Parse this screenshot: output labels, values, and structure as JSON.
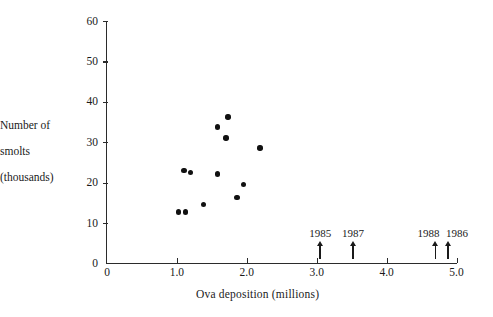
{
  "chart_data": {
    "type": "scatter",
    "title": "",
    "xlabel": "Ova deposition (millions)",
    "ylabel_lines": [
      "Number of",
      "smolts",
      "(thousands)"
    ],
    "ylabel": "Number of smolts (thousands)",
    "xlim": [
      0,
      5.0
    ],
    "ylim": [
      0,
      60
    ],
    "xticks": [
      0,
      1.0,
      2.0,
      3.0,
      4.0,
      5.0
    ],
    "xtick_labels": [
      "0",
      "1.0",
      "2.0",
      "3.0",
      "4.0",
      "5.0"
    ],
    "yticks": [
      0,
      10,
      20,
      30,
      40,
      50,
      60
    ],
    "ytick_labels": [
      "0",
      "10",
      "20",
      "30",
      "40",
      "50",
      "60"
    ],
    "grid": false,
    "legend": "none",
    "marker": "filled-circle",
    "marker_color": "#111111",
    "points": [
      {
        "x": 1.02,
        "y": 12.8
      },
      {
        "x": 1.12,
        "y": 12.8
      },
      {
        "x": 1.1,
        "y": 23.0
      },
      {
        "x": 1.19,
        "y": 22.6
      },
      {
        "x": 1.38,
        "y": 14.6
      },
      {
        "x": 1.58,
        "y": 33.8
      },
      {
        "x": 1.58,
        "y": 22.2
      },
      {
        "x": 1.7,
        "y": 31.1
      },
      {
        "x": 1.73,
        "y": 36.3
      },
      {
        "x": 1.86,
        "y": 16.3
      },
      {
        "x": 1.95,
        "y": 19.5
      },
      {
        "x": 2.19,
        "y": 28.6
      }
    ],
    "annotations": [
      {
        "label": "1985",
        "x": 3.05,
        "type": "up-arrow",
        "label_offset": 0
      },
      {
        "label": "1987",
        "x": 3.52,
        "type": "up-arrow",
        "label_offset": 0
      },
      {
        "label": "1988",
        "x": 4.7,
        "type": "up-arrow",
        "label_offset": -7
      },
      {
        "label": "1986",
        "x": 4.88,
        "type": "up-arrow",
        "label_offset": 9
      }
    ]
  }
}
